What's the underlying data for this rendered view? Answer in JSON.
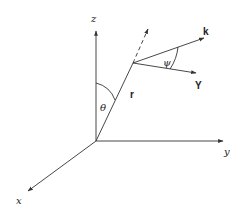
{
  "diagram": {
    "type": "3d-coordinate-system",
    "colors": {
      "stroke": "#333333",
      "text": "#222222",
      "background": "#ffffff"
    },
    "axes": {
      "z": {
        "label": "z"
      },
      "y": {
        "label": "y"
      },
      "x": {
        "label": "x"
      }
    },
    "vectors": {
      "r": {
        "label": "r"
      },
      "k": {
        "label": "k"
      },
      "Y": {
        "label": "Y"
      }
    },
    "angles": {
      "theta": {
        "label": "θ"
      },
      "psi": {
        "label": "ψ"
      }
    }
  }
}
